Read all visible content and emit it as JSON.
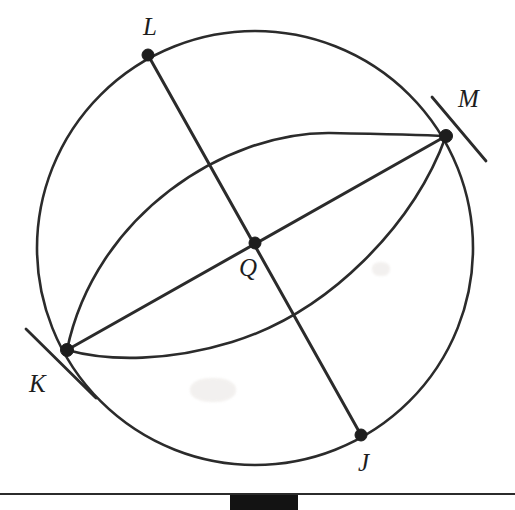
{
  "figure": {
    "background_color": "#ffffff",
    "ink_color": "#2b2b2b",
    "canvas": {
      "width": 515,
      "height": 510
    }
  },
  "circle": {
    "name": "circle-q",
    "center": {
      "x": 255,
      "y": 248
    },
    "radius": 218
  },
  "points": [
    {
      "id": "L",
      "label": "L",
      "x": 148,
      "y": 55,
      "label_x": 143,
      "label_y": 14
    },
    {
      "id": "M",
      "label": "M",
      "x": 446,
      "y": 136,
      "label_x": 458,
      "label_y": 86
    },
    {
      "id": "Q",
      "label": "Q",
      "x": 255,
      "y": 243,
      "label_x": 239,
      "label_y": 255
    },
    {
      "id": "K",
      "label": "K",
      "x": 67,
      "y": 350,
      "label_x": 29,
      "label_y": 371
    },
    {
      "id": "J",
      "label": "J",
      "x": 361,
      "y": 435,
      "label_x": 358,
      "label_y": 450
    }
  ],
  "chords": [
    {
      "name": "chord-LJ",
      "from": "L",
      "to": "J",
      "through": "Q"
    },
    {
      "name": "chord-KM",
      "from": "K",
      "to": "M",
      "through": "Q"
    }
  ],
  "arcs": [
    {
      "name": "arc-upper-KM",
      "from": "K",
      "to": "M",
      "side": "above",
      "apex": {
        "x": 280,
        "y": 140
      }
    },
    {
      "name": "arc-lower-KM",
      "from": "K",
      "to": "M",
      "side": "below",
      "apex": {
        "x": 205,
        "y": 358
      }
    }
  ],
  "tangent_ticks": [
    {
      "name": "tangent-tick-K",
      "at": "K",
      "x1": 26,
      "y1": 329,
      "x2": 96,
      "y2": 398
    },
    {
      "name": "tangent-tick-M",
      "at": "M",
      "x1": 432,
      "y1": 97,
      "x2": 486,
      "y2": 161
    }
  ],
  "bottom": {
    "rule_y": 493,
    "block": {
      "x": 230,
      "y": 495,
      "width": 68,
      "height": 15,
      "color": "#131313"
    }
  }
}
